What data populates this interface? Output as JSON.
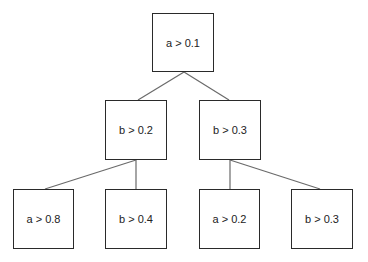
{
  "diagram": {
    "type": "binary decision tree",
    "nodes": [
      {
        "id": "root",
        "label": "a > 0.1",
        "x": 152,
        "y": 13,
        "w": 62,
        "h": 59
      },
      {
        "id": "l",
        "label": "b > 0.2",
        "x": 105,
        "y": 100,
        "w": 62,
        "h": 60
      },
      {
        "id": "r",
        "label": "b > 0.3",
        "x": 199,
        "y": 100,
        "w": 62,
        "h": 60
      },
      {
        "id": "ll",
        "label": "a > 0.8",
        "x": 13,
        "y": 189,
        "w": 61,
        "h": 60
      },
      {
        "id": "lr",
        "label": "b > 0.4",
        "x": 105,
        "y": 189,
        "w": 62,
        "h": 60
      },
      {
        "id": "rl",
        "label": "a > 0.2",
        "x": 199,
        "y": 189,
        "w": 61,
        "h": 60
      },
      {
        "id": "rr",
        "label": "b > 0.3",
        "x": 291,
        "y": 189,
        "w": 62,
        "h": 60
      }
    ],
    "edges": [
      {
        "from": "root",
        "to": "l",
        "x1": 184,
        "y1": 72,
        "x2": 138,
        "y2": 100
      },
      {
        "from": "root",
        "to": "r",
        "x1": 184,
        "y1": 72,
        "x2": 229,
        "y2": 100
      },
      {
        "from": "l",
        "to": "ll",
        "x1": 136,
        "y1": 160,
        "x2": 45,
        "y2": 189
      },
      {
        "from": "l",
        "to": "lr",
        "x1": 136,
        "y1": 160,
        "x2": 136,
        "y2": 189
      },
      {
        "from": "r",
        "to": "rl",
        "x1": 230,
        "y1": 160,
        "x2": 230,
        "y2": 189
      },
      {
        "from": "r",
        "to": "rr",
        "x1": 230,
        "y1": 160,
        "x2": 320,
        "y2": 189
      }
    ]
  }
}
